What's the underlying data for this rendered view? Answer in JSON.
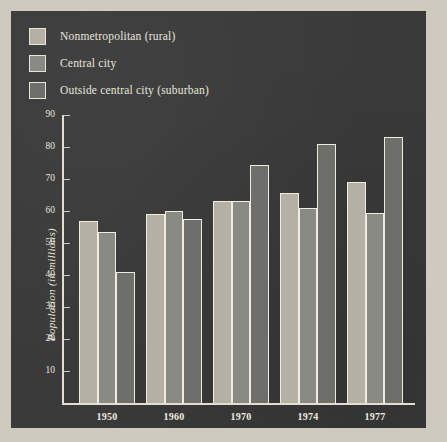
{
  "chart_data": {
    "type": "bar",
    "title": "",
    "xlabel": "",
    "ylabel": "Population (in millions)",
    "categories": [
      "1950",
      "1960",
      "1970",
      "1974",
      "1977"
    ],
    "series": [
      {
        "name": "Nonmetropolitan (rural)",
        "color": "#b4b0a6",
        "values": [
          57,
          59,
          63,
          65.5,
          69
        ]
      },
      {
        "name": "Central city",
        "color": "#8a8a85",
        "values": [
          53.5,
          60,
          63,
          61,
          59.5
        ]
      },
      {
        "name": "Outside central city (suburban)",
        "color": "#6e6e6b",
        "values": [
          41,
          57.5,
          74.5,
          81,
          83
        ]
      }
    ],
    "ylim": [
      0,
      90
    ],
    "yticks": [
      10,
      20,
      30,
      40,
      50,
      60,
      70,
      80,
      90
    ],
    "ytick_labels": [
      "10",
      "20",
      "30",
      "40",
      "50",
      "60",
      "70",
      "80",
      "90"
    ],
    "grid": false,
    "legend_position": "top-left"
  },
  "legend": {
    "items": [
      {
        "label": "Nonmetropolitan (rural)",
        "swatch": "#b4b0a6"
      },
      {
        "label": "Central city",
        "swatch": "#8a8a85"
      },
      {
        "label": "Outside central city (suburban)",
        "swatch": "#6e6e6b"
      }
    ]
  },
  "colors": {
    "page_background": "#cfcac0",
    "panel_background": "#3a3a3a",
    "text": "#e9e5da",
    "axis": "#e2ded2",
    "bar_outline": "#efebe0"
  }
}
